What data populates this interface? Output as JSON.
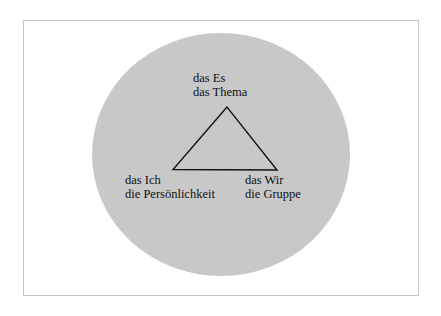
{
  "diagram": {
    "type": "triangle-in-circle",
    "colors": {
      "circle_fill": "#c8c8c8",
      "frame_border": "#c6c6c6",
      "triangle_stroke": "#111111",
      "text": "#111111"
    },
    "nodes": [
      {
        "id": "top",
        "line1": "das Es",
        "line2": "das Thema"
      },
      {
        "id": "bottom-left",
        "line1": "das Ich",
        "line2": "die Persönlichkeit"
      },
      {
        "id": "bottom-right",
        "line1": "das Wir",
        "line2": "die Gruppe"
      }
    ],
    "edges": [
      [
        "top",
        "bottom-left"
      ],
      [
        "bottom-left",
        "bottom-right"
      ],
      [
        "bottom-right",
        "top"
      ]
    ]
  }
}
